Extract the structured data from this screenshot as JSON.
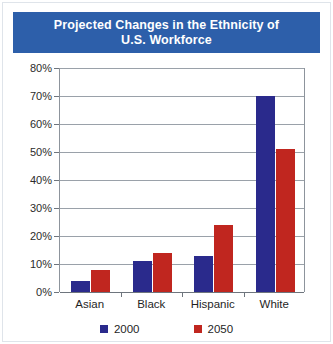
{
  "title": {
    "line1": "Projected Changes in the Ethnicity of",
    "line2": "U.S. Workforce",
    "full": "Projected Changes in the Ethnicity of\nU.S. Workforce"
  },
  "colors": {
    "banner": "#2d5faa",
    "series_2000": "#2a2a8c",
    "series_2050": "#c0261f",
    "gridline": "#9aa1a9",
    "axis": "#6e757d",
    "background": "#ffffff",
    "title_text": "#ffffff"
  },
  "legend": {
    "position": "bottom-center",
    "items": [
      {
        "label": "2000",
        "color": "#2a2a8c"
      },
      {
        "label": "2050",
        "color": "#c0261f"
      }
    ]
  },
  "axes": {
    "y_ticks": [
      "0%",
      "10%",
      "20%",
      "30%",
      "40%",
      "50%",
      "60%",
      "70%",
      "80%"
    ],
    "y_tick_values": [
      0,
      10,
      20,
      30,
      40,
      50,
      60,
      70,
      80
    ],
    "x_ticks": [
      "Asian",
      "Black",
      "Hispanic",
      "White"
    ]
  },
  "chart_data": {
    "type": "bar",
    "title": "Projected Changes in the Ethnicity of U.S. Workforce",
    "xlabel": "",
    "ylabel": "",
    "categories": [
      "Asian",
      "Black",
      "Hispanic",
      "White"
    ],
    "series": [
      {
        "name": "2000",
        "color": "#2a2a8c",
        "values": [
          4,
          11,
          13,
          70
        ]
      },
      {
        "name": "2050",
        "color": "#c0261f",
        "values": [
          8,
          14,
          24,
          51
        ]
      }
    ],
    "ylim": [
      0,
      80
    ],
    "ytick_step": 10,
    "ytick_format": "percent",
    "grid": true,
    "legend_position": "bottom"
  }
}
